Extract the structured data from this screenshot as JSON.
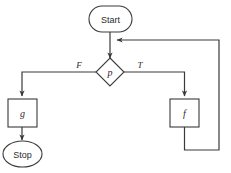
{
  "diagram": {
    "background_color": "#ffffff",
    "stroke_color": "#3a3a3a",
    "text_color": "#2b2b2b",
    "nodes": [
      {
        "id": "start",
        "label": "Start",
        "shape": "stadium"
      },
      {
        "id": "decision",
        "label": "p",
        "shape": "diamond"
      },
      {
        "id": "process_g",
        "label": "g",
        "shape": "rectangle"
      },
      {
        "id": "process_f",
        "label": "f",
        "shape": "rectangle"
      },
      {
        "id": "stop",
        "label": "Stop",
        "shape": "ellipse"
      }
    ],
    "edges": [
      {
        "id": "start-to-decision",
        "from": "start",
        "to": "decision",
        "label": ""
      },
      {
        "id": "false-branch",
        "from": "decision",
        "to": "process_g",
        "label": "F"
      },
      {
        "id": "true-branch",
        "from": "decision",
        "to": "process_f",
        "label": "T"
      },
      {
        "id": "g-to-stop",
        "from": "process_g",
        "to": "stop",
        "label": ""
      },
      {
        "id": "loop-back",
        "from": "process_f",
        "to": "decision",
        "label": ""
      }
    ],
    "branch_labels": {
      "false": "F",
      "true": "T"
    }
  }
}
